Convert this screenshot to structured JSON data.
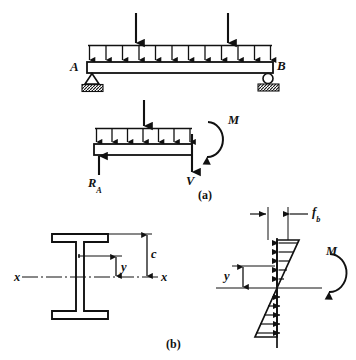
{
  "figure": {
    "background_color": "#ffffff",
    "ink_color": "#111111"
  },
  "panel_a": {
    "caption": "(a)",
    "beam": {
      "support_left_label": "A",
      "support_right_label": "B",
      "support_left_type": "pin-support",
      "support_right_type": "roller-support",
      "distributed_load_arrow_count": 12,
      "point_load_count": 2
    },
    "free_body": {
      "reaction_label": "R",
      "reaction_subscript": "A",
      "shear_label": "V",
      "moment_label": "M",
      "distributed_load_arrow_count": 7,
      "point_load_count": 1
    }
  },
  "panel_b": {
    "caption": "(b)",
    "cross_section": {
      "shape": "wide-flange-I-beam",
      "axis_label_left": "x",
      "axis_label_right": "x",
      "dim_y_label": "y",
      "dim_c_label": "c"
    },
    "stress_block": {
      "stress_label": "f",
      "stress_subscript": "b",
      "dim_y_label": "y",
      "moment_label": "M",
      "compression_arrow_count": 5,
      "tension_arrow_count": 5,
      "description": "linear bending stress distribution, compression above neutral axis, tension below"
    }
  }
}
